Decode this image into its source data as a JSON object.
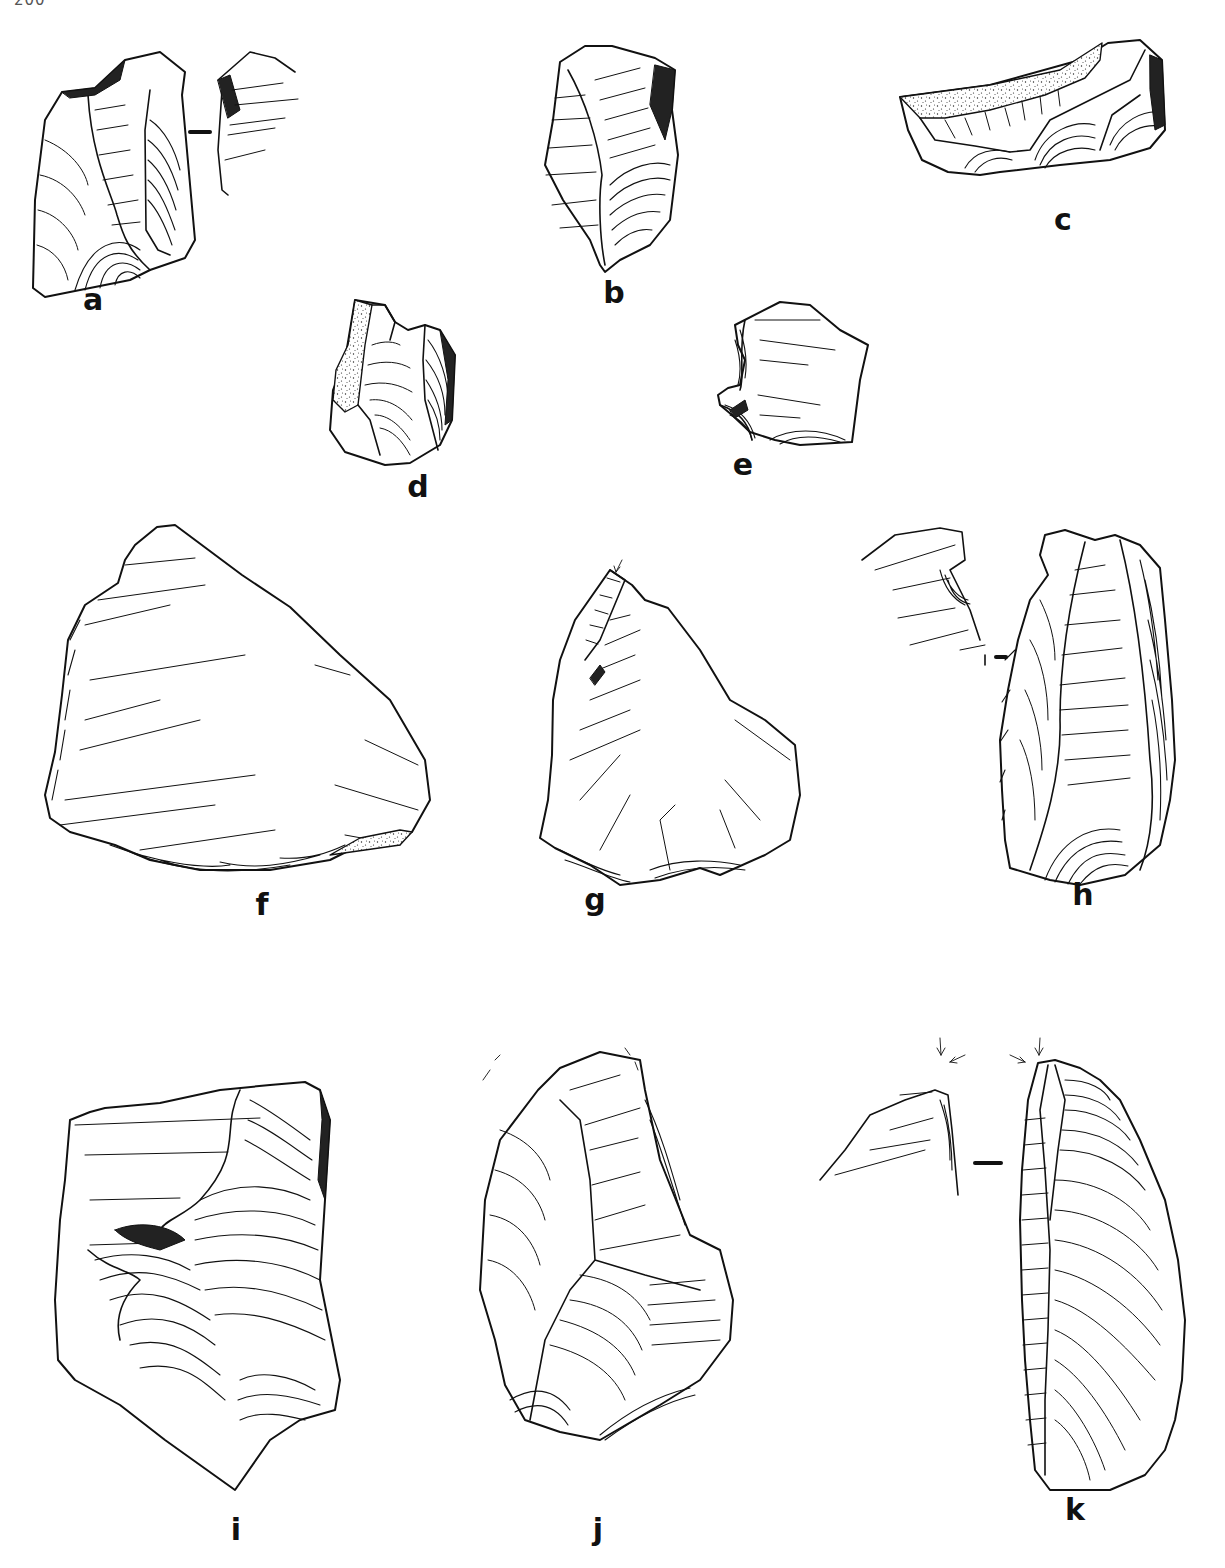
{
  "page": {
    "number": "200"
  },
  "plate": {
    "description": "Line drawings of flaked stone (lithic) artifacts",
    "figures": [
      {
        "id": "a",
        "label": "a",
        "label_pos": [
          93,
          305
        ],
        "views": 2,
        "has_section_marker": true
      },
      {
        "id": "b",
        "label": "b",
        "label_pos": [
          614,
          300
        ]
      },
      {
        "id": "c",
        "label": "c",
        "label_pos": [
          1063,
          227
        ],
        "has_cortex": true
      },
      {
        "id": "d",
        "label": "d",
        "label_pos": [
          418,
          494
        ],
        "has_cortex": true
      },
      {
        "id": "e",
        "label": "e",
        "label_pos": [
          743,
          470
        ]
      },
      {
        "id": "f",
        "label": "f",
        "label_pos": [
          262,
          912
        ],
        "has_cortex": true
      },
      {
        "id": "g",
        "label": "g",
        "label_pos": [
          595,
          912
        ],
        "has_arrow": true
      },
      {
        "id": "h",
        "label": "h",
        "label_pos": [
          1083,
          912
        ],
        "views": 2,
        "has_section_marker": true
      },
      {
        "id": "i",
        "label": "i",
        "label_pos": [
          236,
          1542
        ]
      },
      {
        "id": "j",
        "label": "j",
        "label_pos": [
          598,
          1542
        ]
      },
      {
        "id": "k",
        "label": "k",
        "label_pos": [
          1075,
          1520
        ],
        "views": 2,
        "has_section_marker": true,
        "has_arrow": true
      }
    ]
  }
}
